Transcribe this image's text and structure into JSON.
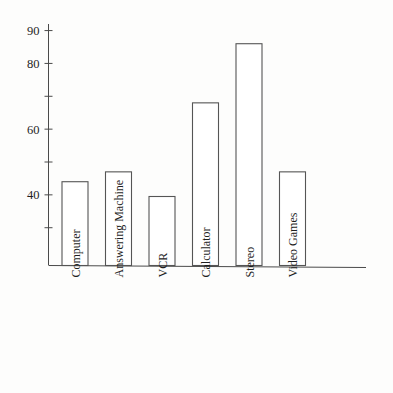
{
  "chart_data": {
    "type": "bar",
    "title": "",
    "subtitle": "",
    "xlabel": "",
    "ylabel": "",
    "categories": [
      "Computer",
      "Answering Machine",
      "VCR",
      "Calculator",
      "Stereo",
      "Video Games"
    ],
    "values": [
      44,
      47,
      39.5,
      68,
      86,
      47
    ],
    "ylim": [
      18.5,
      92
    ],
    "yticks": [
      30,
      40,
      50,
      60,
      70,
      80,
      90
    ],
    "ytick_labels": [
      "",
      "40",
      "",
      "60",
      "",
      "80",
      "90"
    ],
    "grid": false,
    "legend": null,
    "bar_style": "hollow-outline",
    "colors": {
      "bar_fill": "#ffffff",
      "bar_stroke": "#555555",
      "axis": "#4a4a4a",
      "text": "#1f1f1f",
      "background": "#fdfdfc"
    }
  },
  "axes": {
    "y_axis_name": "value-axis",
    "x_axis_name": "category-axis"
  }
}
